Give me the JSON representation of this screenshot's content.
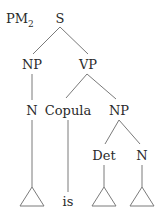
{
  "diagram": {
    "title": "PM",
    "title_subscript": "2",
    "nodes": {
      "s": "S",
      "np1": "NP",
      "vp": "VP",
      "n1": "N",
      "copula": "Copula",
      "np2": "NP",
      "det": "Det",
      "n2": "N",
      "is": "is"
    },
    "colors": {
      "ink": "#2a2a2a",
      "line": "#7a7a7a"
    }
  }
}
